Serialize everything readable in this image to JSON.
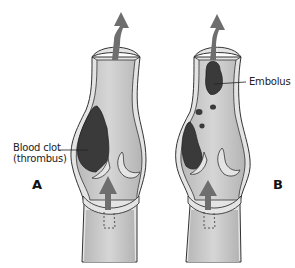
{
  "figure": {
    "type": "medical-illustration",
    "panels": [
      {
        "id": "A",
        "letter": "A",
        "label_line1": "Blood clot",
        "label_line2": "(thrombus)"
      },
      {
        "id": "B",
        "letter": "B",
        "label": "Embolus"
      }
    ],
    "colors": {
      "vessel_fill": "#c8c8c8",
      "vessel_wall": "#e6e6e6",
      "outline": "#333333",
      "clot": "#3a3a3a",
      "arrow": "#6e6e6e",
      "background": "#ffffff"
    }
  }
}
